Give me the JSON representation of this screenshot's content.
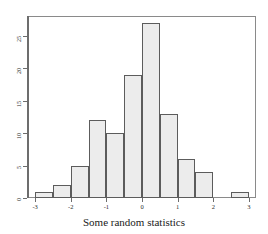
{
  "chart_data": {
    "type": "bar",
    "title": "",
    "subtitle": "",
    "caption": "Some random statistics",
    "xlabel": "",
    "ylabel": "",
    "bin_width": 0.5,
    "bin_edges": [
      -3,
      -2.5,
      -2,
      -1.5,
      -1,
      -0.5,
      0,
      0.5,
      1,
      1.5,
      2,
      2.5,
      3
    ],
    "categories": [
      "-3 to -2.5",
      "-2.5 to -2",
      "-2 to -1.5",
      "-1.5 to -1",
      "-1 to -0.5",
      "-0.5 to 0",
      "0 to 0.5",
      "0.5 to 1",
      "1 to 1.5",
      "1.5 to 2",
      "2 to 2.5",
      "2.5 to 3"
    ],
    "values": [
      1,
      2,
      5,
      12,
      10,
      19,
      27,
      13,
      6,
      4,
      0,
      1
    ],
    "xlim": [
      -3.2,
      3.2
    ],
    "ylim": [
      0,
      28
    ],
    "xticks": [
      -3,
      -2,
      -1,
      0,
      1,
      2,
      3
    ],
    "xtick_labels": [
      "-3",
      "-2",
      "-1",
      "0",
      "1",
      "2",
      "3"
    ],
    "yticks": [
      0,
      5,
      10,
      15,
      20,
      25
    ],
    "ytick_labels": [
      "0",
      "5",
      "10",
      "15",
      "20",
      "25"
    ],
    "grid": false,
    "legend": null,
    "bar_fill_color": "#ececec",
    "bar_border_color": "#5c5c5c",
    "axis_color": "#6d6d6d",
    "frame_color": "#8a8a8a",
    "text_color": "#2b2b2b",
    "background_color": "#ffffff"
  }
}
